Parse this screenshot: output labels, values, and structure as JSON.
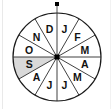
{
  "figure": {
    "kind": "spinner-wheel",
    "sector_count": 12,
    "sector_angle_degrees": 30,
    "center": {
      "x": 57,
      "y": 57
    },
    "radius": 44,
    "colors": {
      "background": "#ffffff",
      "outline": "#1a1a1a",
      "spoke": "#2b2b2b",
      "sector_fill": "#ffffff",
      "highlight_fill": "#d9d9d9",
      "label_text": "#111111",
      "hub": "#000000",
      "pointer": "#000000",
      "frame_rule": "#e9e9e9"
    },
    "hub": {
      "shape": "square",
      "size": 5,
      "color": "#000000"
    },
    "pointer": {
      "shape": "dot",
      "position": "top",
      "angle_degrees": 0,
      "size": 4,
      "color": "#000000"
    }
  },
  "sectors": [
    {
      "index": 0,
      "label": "J",
      "month": "January",
      "start_deg": 0,
      "end_deg": 30,
      "highlighted": false
    },
    {
      "index": 1,
      "label": "F",
      "month": "February",
      "start_deg": 30,
      "end_deg": 60,
      "highlighted": false
    },
    {
      "index": 2,
      "label": "M",
      "month": "March",
      "start_deg": 60,
      "end_deg": 90,
      "highlighted": false
    },
    {
      "index": 3,
      "label": "A",
      "month": "April",
      "start_deg": 90,
      "end_deg": 120,
      "highlighted": false
    },
    {
      "index": 4,
      "label": "M",
      "month": "May",
      "start_deg": 120,
      "end_deg": 150,
      "highlighted": false
    },
    {
      "index": 5,
      "label": "J",
      "month": "June",
      "start_deg": 150,
      "end_deg": 180,
      "highlighted": false
    },
    {
      "index": 6,
      "label": "J",
      "month": "July",
      "start_deg": 180,
      "end_deg": 210,
      "highlighted": false
    },
    {
      "index": 7,
      "label": "A",
      "month": "August",
      "start_deg": 210,
      "end_deg": 240,
      "highlighted": false
    },
    {
      "index": 8,
      "label": "S",
      "month": "September",
      "start_deg": 240,
      "end_deg": 270,
      "highlighted": true
    },
    {
      "index": 9,
      "label": "O",
      "month": "October",
      "start_deg": 270,
      "end_deg": 300,
      "highlighted": false
    },
    {
      "index": 10,
      "label": "N",
      "month": "November",
      "start_deg": 300,
      "end_deg": 330,
      "highlighted": false
    },
    {
      "index": 11,
      "label": "D",
      "month": "December",
      "start_deg": 330,
      "end_deg": 360,
      "highlighted": false
    }
  ]
}
